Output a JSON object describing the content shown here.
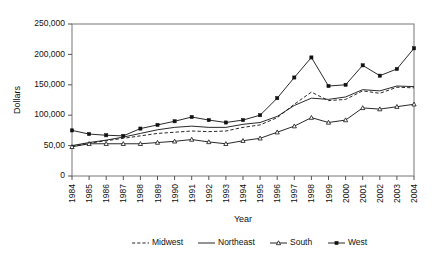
{
  "chart_data": {
    "type": "line",
    "title": "",
    "xlabel": "Year",
    "ylabel": "Dollars",
    "ylim": [
      0,
      250000
    ],
    "yticks": [
      0,
      50000,
      100000,
      150000,
      200000,
      250000
    ],
    "ytick_labels": [
      "0",
      "50,00",
      "100,000",
      "150,000",
      "200,000",
      "250,000"
    ],
    "grid": false,
    "legend_position": "bottom",
    "categories": [
      "1984",
      "1985",
      "1986",
      "1987",
      "1988",
      "1989",
      "1990",
      "1991",
      "1992",
      "1993",
      "1994",
      "1995",
      "1996",
      "1997",
      "1998",
      "1999",
      "2000",
      "2001",
      "2002",
      "2003",
      "2004"
    ],
    "series": [
      {
        "name": "Midwest",
        "style": "dashed",
        "marker": "none",
        "color": "#111111",
        "values": [
          49000,
          54000,
          58000,
          62000,
          66000,
          70000,
          72000,
          74000,
          73000,
          74000,
          80000,
          84000,
          96000,
          118000,
          138000,
          124000,
          126000,
          140000,
          136000,
          146000,
          145000
        ]
      },
      {
        "name": "Northeast",
        "style": "solid",
        "marker": "none",
        "color": "#111111",
        "values": [
          50000,
          55000,
          59000,
          64000,
          70000,
          76000,
          80000,
          82000,
          80000,
          80000,
          85000,
          88000,
          98000,
          116000,
          128000,
          126000,
          130000,
          142000,
          140000,
          148000,
          147000
        ]
      },
      {
        "name": "South",
        "style": "solid",
        "marker": "triangle-open",
        "color": "#111111",
        "values": [
          48000,
          53000,
          53000,
          53000,
          53000,
          55000,
          57000,
          60000,
          56000,
          53000,
          58000,
          62000,
          72000,
          82000,
          96000,
          88000,
          92000,
          112000,
          110000,
          114000,
          118000
        ]
      },
      {
        "name": "West",
        "style": "solid",
        "marker": "square-filled",
        "color": "#111111",
        "values": [
          75000,
          69000,
          67000,
          66000,
          78000,
          84000,
          90000,
          97000,
          92000,
          88000,
          92000,
          100000,
          128000,
          162000,
          195000,
          148000,
          150000,
          182000,
          165000,
          176000,
          210000
        ]
      }
    ]
  },
  "legend": {
    "items": [
      {
        "label": "Midwest"
      },
      {
        "label": "Northeast"
      },
      {
        "label": "South"
      },
      {
        "label": "West"
      }
    ]
  }
}
